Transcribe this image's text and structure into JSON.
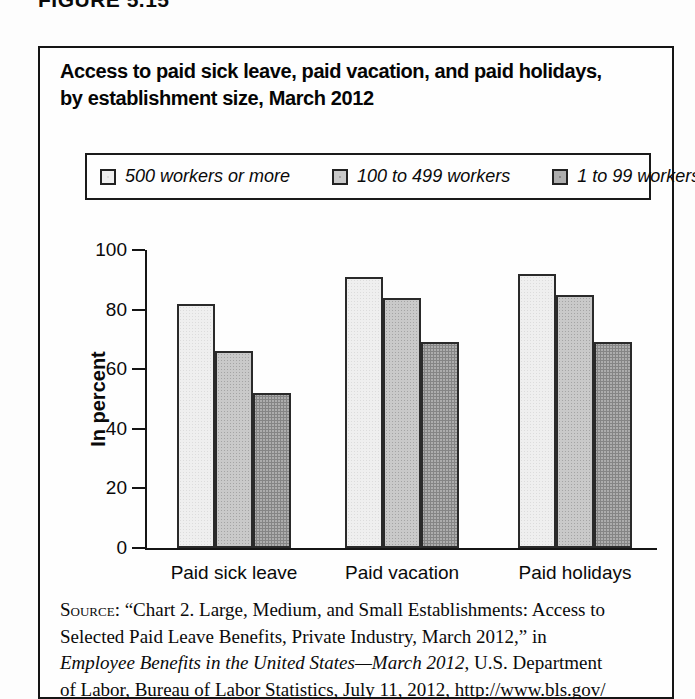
{
  "figure_label": "FIGURE 5.15",
  "header": {
    "title_lines": [
      "Access to paid sick leave, paid vacation, and paid holidays,",
      "by establishment size, March 2012"
    ]
  },
  "legend": {
    "items": [
      {
        "label": "500 workers or more",
        "color": "#efefef"
      },
      {
        "label": "100 to 499 workers",
        "color": "#c9c9c9"
      },
      {
        "label": "1 to 99 workers",
        "color": "#adadad"
      }
    ]
  },
  "chart_data": {
    "type": "bar",
    "title": "Access to paid sick leave, paid vacation, and paid holidays, by establishment size, March 2012",
    "categories": [
      "Paid sick leave",
      "Paid vacation",
      "Paid holidays"
    ],
    "series": [
      {
        "name": "500 workers or more",
        "color": "#efefef",
        "values": [
          82,
          91,
          92
        ]
      },
      {
        "name": "100 to 499 workers",
        "color": "#c9c9c9",
        "values": [
          66,
          84,
          85
        ]
      },
      {
        "name": "1 to 99 workers",
        "color": "#adadad",
        "values": [
          52,
          69,
          69
        ]
      }
    ],
    "xlabel": "",
    "ylabel": "In percent",
    "ylim": [
      0,
      100
    ],
    "yticks": [
      0,
      20,
      40,
      60,
      80,
      100
    ],
    "grid": false,
    "legend_position": "top"
  },
  "source": {
    "lines": [
      [
        {
          "t": "Source:",
          "sc": true
        },
        {
          "t": " “Chart 2. Large, Medium, and Small Establishments: Access to"
        }
      ],
      [
        {
          "t": "Selected Paid Leave Benefits, Private Industry, March 2012,” in"
        }
      ],
      [
        {
          "t": "Employee Benefits in the United States—March 2012",
          "i": true
        },
        {
          "t": ", U.S. Department"
        }
      ],
      [
        {
          "t": "of Labor, Bureau of Labor Statistics, July 11, 2012, http://www.bls.gov/"
        }
      ]
    ]
  }
}
